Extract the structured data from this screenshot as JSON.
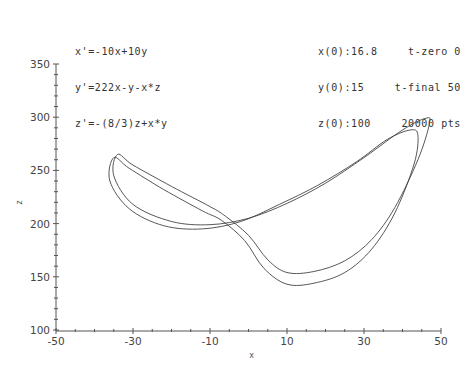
{
  "header": {
    "equations": [
      "x'=-10x+10y",
      "y'=222x-y-x*z",
      "z'=-(8/3)z+x*y"
    ],
    "initial_conditions": [
      "x(0):16.8",
      "y(0):15",
      "z(0):100"
    ],
    "run_settings": [
      "t-zero 0",
      "t-final 50",
      "20000 pts"
    ]
  },
  "chart_data": {
    "type": "line",
    "title": "",
    "xlabel": "x",
    "ylabel": "z",
    "xlim": [
      -50,
      50
    ],
    "ylim": [
      100,
      350
    ],
    "x_ticks": [
      -50,
      -30,
      -10,
      10,
      30,
      50
    ],
    "y_ticks": [
      100,
      150,
      200,
      250,
      300,
      350
    ],
    "grid": false,
    "legend": null,
    "series": [
      {
        "name": "trajectory (x vs z), outer loop",
        "points": [
          [
            -34,
            265
          ],
          [
            -30,
            255
          ],
          [
            -20,
            235
          ],
          [
            -10,
            216
          ],
          [
            -6,
            207
          ],
          [
            0,
            189
          ],
          [
            5,
            166
          ],
          [
            10,
            154
          ],
          [
            17,
            155
          ],
          [
            25,
            165
          ],
          [
            32,
            185
          ],
          [
            38,
            215
          ],
          [
            44,
            260
          ],
          [
            47,
            294
          ],
          [
            46,
            299
          ],
          [
            40,
            288
          ],
          [
            30,
            262
          ],
          [
            20,
            238
          ],
          [
            10,
            219
          ],
          [
            0,
            205
          ],
          [
            -10,
            199
          ],
          [
            -20,
            202
          ],
          [
            -30,
            218
          ],
          [
            -35,
            245
          ],
          [
            -34,
            265
          ]
        ]
      },
      {
        "name": "trajectory (x vs z), inner loop",
        "points": [
          [
            -35,
            262
          ],
          [
            -31,
            252
          ],
          [
            -22,
            232
          ],
          [
            -12,
            212
          ],
          [
            -7,
            203
          ],
          [
            -1,
            184
          ],
          [
            4,
            158
          ],
          [
            10,
            143
          ],
          [
            17,
            144
          ],
          [
            25,
            154
          ],
          [
            32,
            176
          ],
          [
            38,
            210
          ],
          [
            43,
            256
          ],
          [
            44,
            283
          ],
          [
            42,
            288
          ],
          [
            36,
            279
          ],
          [
            28,
            258
          ],
          [
            18,
            236
          ],
          [
            8,
            218
          ],
          [
            -2,
            202
          ],
          [
            -12,
            195
          ],
          [
            -22,
            198
          ],
          [
            -31,
            214
          ],
          [
            -36,
            240
          ],
          [
            -35,
            262
          ]
        ]
      }
    ]
  }
}
